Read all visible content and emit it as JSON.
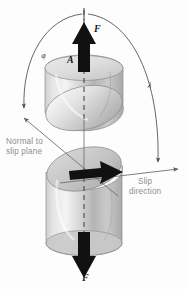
{
  "figure": {
    "type": "schematic-diagram",
    "background_color": "#fdfdfd"
  },
  "labels": {
    "normal_to_slip_plane": "Normal to\nslip plane",
    "slip_direction": "Slip\ndirection",
    "force_top": "F",
    "force_bottom": "F",
    "area": "A",
    "angle_phi": "φ",
    "angle_lambda": "λ"
  },
  "colors": {
    "text_gray": "#8f8f8f",
    "text_dark": "#1a1a1a",
    "arrow_black": "#111111",
    "leader_line": "#6f6f6f",
    "cylinder_light": "#f2f2f2",
    "cylinder_mid": "#bdbdbd",
    "cylinder_dark": "#9a9a9a",
    "ellipse_face": "#d9d9d9",
    "axis_dash": "#3a3a3a"
  },
  "elements": {
    "top_cylinder": "upper half of sectioned cylinder with elliptical slip plane face",
    "bottom_cylinder": "lower half of sectioned cylinder with elliptical slip plane face",
    "tensile_arrow_up": "bold black arrow pointing up labeled F",
    "tensile_arrow_down": "bold black arrow pointing down labeled F",
    "shear_arrow": "bold black horizontal arrow on the slip plane pointing right",
    "axis_line": "dashed vertical loading axis through both cylinders",
    "normal_line": "straight leader line from slip plane down-left, normal to slip plane",
    "slip_direction_line": "straight leader line from slip plane to the right",
    "arc_phi": "curved arc from loading axis to the slip plane normal, labeled phi",
    "arc_lambda": "curved arc from loading axis to the slip direction, labeled lambda"
  }
}
